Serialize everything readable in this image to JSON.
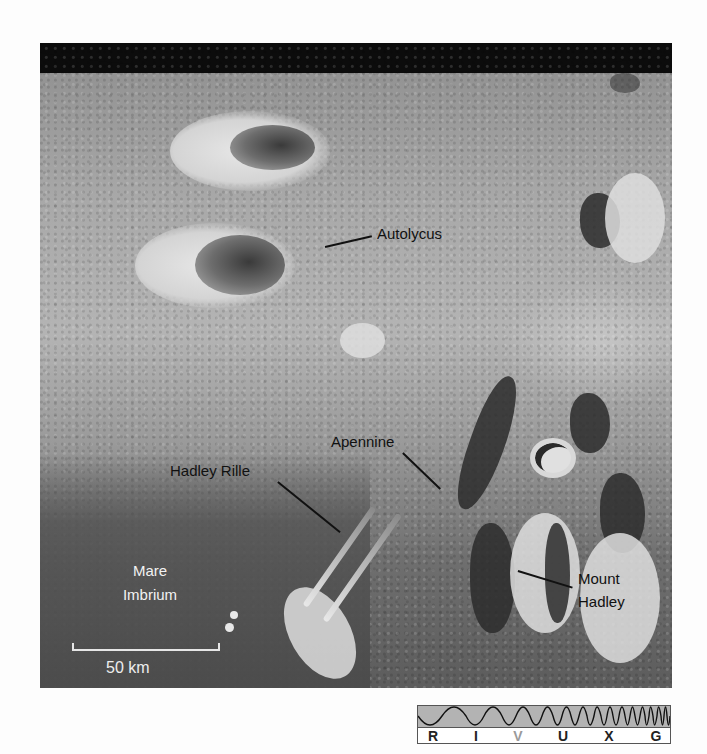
{
  "figure": {
    "labels": {
      "autolycus": "Autolycus",
      "apennine": "Apennine",
      "hadley_rille": "Hadley Rille",
      "mount_hadley_line1": "Mount",
      "mount_hadley_line2": "Hadley",
      "mare_line1": "Mare",
      "mare_line2": "Imbrium"
    },
    "scale_bar": {
      "label": "50 km"
    },
    "spectrum_bar": {
      "bands": [
        "R",
        "I",
        "V",
        "U",
        "X",
        "G"
      ],
      "highlighted": "V",
      "wave_color": "#b3b3b3",
      "highlight_color": "#9a9a9a"
    },
    "colors": {
      "sky": "#0c0c0c",
      "label_text": "#111111",
      "mare_label_text": "#f2f2f2"
    }
  }
}
